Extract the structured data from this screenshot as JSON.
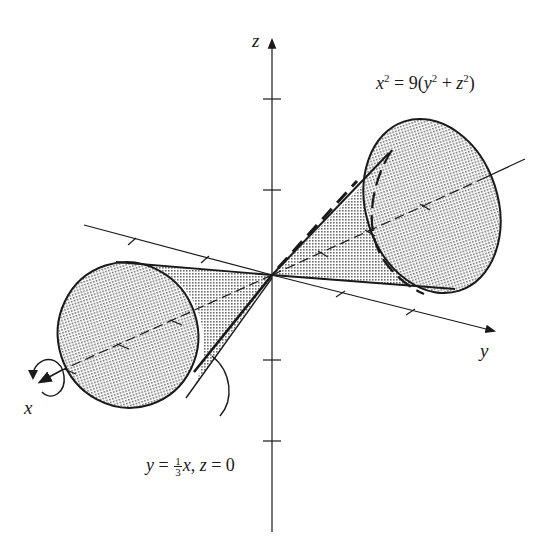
{
  "figure": {
    "axes": {
      "x_label": "x",
      "y_label": "y",
      "z_label": "z"
    },
    "surface_equation": {
      "lhs_var": "x",
      "lhs_exp": "2",
      "equals": "=",
      "coef": "9(",
      "y_var": "y",
      "y_exp": "2",
      "plus": "+",
      "z_var": "z",
      "z_exp": "2",
      "close": ")"
    },
    "generator_equation": {
      "y_var": "y",
      "equals1": "=",
      "frac_num": "1",
      "frac_den": "3",
      "x_var": "x",
      "sep": ",",
      "z_var": "z",
      "equals2": "=",
      "value": "0"
    },
    "rotation_indicator": "rotation-about-x-axis",
    "colors": {
      "ink": "#1a1a1a",
      "shade": "#bdbdbd",
      "background": "#ffffff"
    }
  }
}
